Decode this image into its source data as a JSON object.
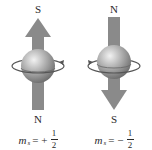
{
  "figure": {
    "colors": {
      "arrow": "#8a8a8a",
      "sphere_light": "#e0e0e0",
      "sphere_dark": "#777777",
      "orbit": "#555555",
      "text": "#2a2a2a"
    },
    "panels": [
      {
        "name": "spin-up",
        "top_pole": "S",
        "bottom_pole": "N",
        "arrow_direction": "up",
        "rotation_arrow_side": "right",
        "formula": {
          "symbol": "m",
          "subscript": "s",
          "equals": "=",
          "sign": "+",
          "numerator": "1",
          "denominator": "2"
        }
      },
      {
        "name": "spin-down",
        "top_pole": "N",
        "bottom_pole": "S",
        "arrow_direction": "down",
        "rotation_arrow_side": "left",
        "formula": {
          "symbol": "m",
          "subscript": "s",
          "equals": "=",
          "sign": "−",
          "numerator": "1",
          "denominator": "2"
        }
      }
    ]
  }
}
